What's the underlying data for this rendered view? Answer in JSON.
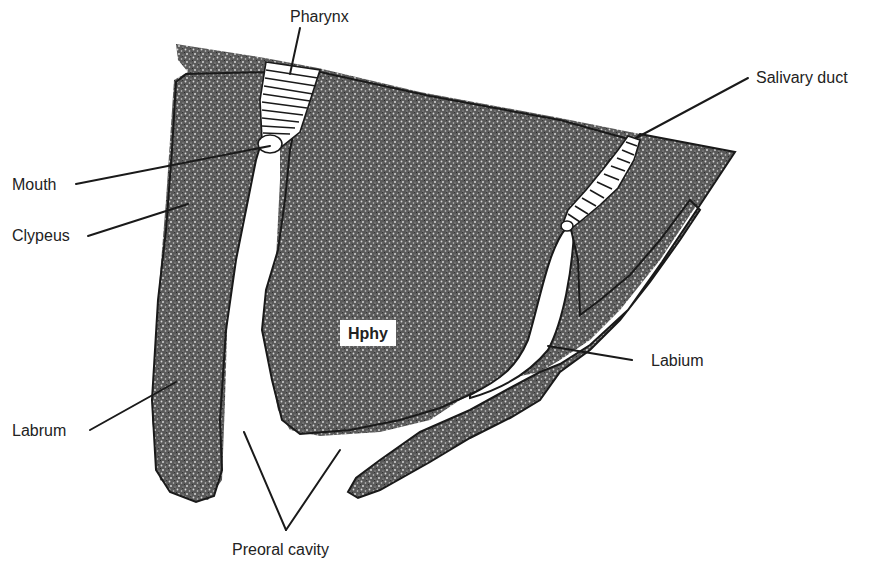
{
  "figure": {
    "labels": {
      "pharynx": "Pharynx",
      "salivary_duct": "Salivary duct",
      "mouth": "Mouth",
      "clypeus": "Clypeus",
      "hypopharynx": "Hphy",
      "labium": "Labium",
      "labrum": "Labrum",
      "preoral_cavity": "Preoral cavity"
    },
    "colors": {
      "ink": "#1a1a1a",
      "stipple_dark": "#3a3a3a",
      "stipple_light": "#9a9a9a",
      "background": "#ffffff"
    }
  }
}
